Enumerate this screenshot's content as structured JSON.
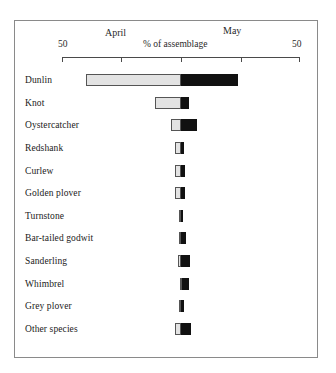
{
  "chart_data": {
    "type": "bar",
    "orientation": "horizontal",
    "layout": "diverging-stacked",
    "title": "",
    "xlabel": "% of assemblage",
    "ylabel": "",
    "axis": {
      "left_end_label": "50",
      "right_end_label": "50",
      "center_value": 0,
      "xlim": [
        -50,
        50
      ],
      "ticks": [
        -50,
        -25,
        0,
        25,
        50
      ],
      "tick_labels": [
        "50",
        "",
        "",
        "",
        "50"
      ],
      "grid": false
    },
    "legend": {
      "position": "above-axis",
      "entries": [
        {
          "name": "April",
          "color": "#e3e3e3"
        },
        {
          "name": "May",
          "color": "#111111"
        }
      ]
    },
    "categories": [
      "Dunlin",
      "Knot",
      "Oystercatcher",
      "Redshank",
      "Curlew",
      "Golden plover",
      "Turnstone",
      "Bar-tailed godwit",
      "Sanderling",
      "Whimbrel",
      "Grey plover",
      "Other species"
    ],
    "series": [
      {
        "name": "April",
        "values": [
          40.0,
          11.0,
          4.0,
          2.4,
          2.4,
          2.4,
          1.0,
          1.0,
          1.2,
          0.4,
          1.0,
          2.4
        ]
      },
      {
        "name": "May",
        "values": [
          24.0,
          3.2,
          6.6,
          1.4,
          1.6,
          1.6,
          1.0,
          2.0,
          3.6,
          3.0,
          1.4,
          4.0
        ]
      }
    ]
  },
  "axis_header": {
    "april_label": "April",
    "may_label": "May",
    "axis_title": "% of assemblage",
    "left_value": "50",
    "right_value": "50"
  }
}
